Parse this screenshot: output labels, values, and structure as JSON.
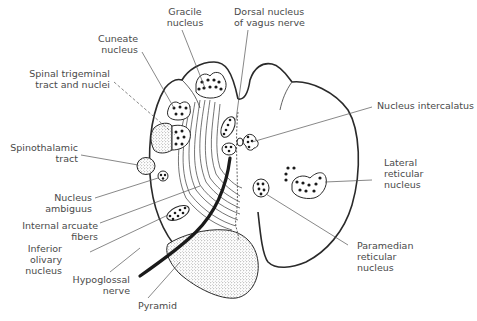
{
  "figure": {
    "colors": {
      "outline": "#2a2a2a",
      "label_text": "#4a4a4a",
      "background": "#ffffff"
    }
  },
  "labels": {
    "gracile_nucleus": "Gracile\nnucleus",
    "dorsal_nucleus_vagus": "Dorsal nucleus\nof vagus nerve",
    "cuneate_nucleus": "Cuneate\nnucleus",
    "spinal_trigeminal": "Spinal trigeminal\ntract and nuclei",
    "nucleus_intercalatus": "Nucleus intercalatus",
    "spinothalamic_tract": "Spinothalamic\ntract",
    "lateral_reticular_nucleus": "Lateral\nreticular\nnucleus",
    "nucleus_ambiguus": "Nucleus\nambiguus",
    "internal_arcuate_fibers": "Internal arcuate\nfibers",
    "inferior_olivary_nucleus": "Inferior\nolivary\nnucleus",
    "hypoglossal_nerve": "Hypoglossal\nnerve",
    "paramedian_reticular_nucleus": "Paramedian\nreticular\nnucleus",
    "pyramid": "Pyramid"
  }
}
